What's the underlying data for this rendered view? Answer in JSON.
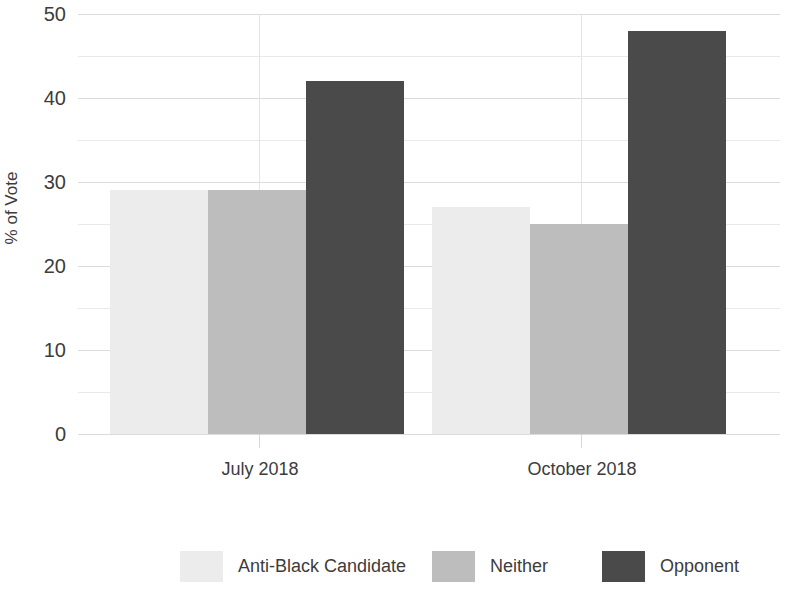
{
  "chart_data": {
    "type": "bar",
    "title": "",
    "xlabel": "",
    "ylabel": "% of Vote",
    "categories": [
      "July 2018",
      "October 2018"
    ],
    "series": [
      {
        "name": "Anti-Black Candidate",
        "color": "#ececec",
        "values": [
          29,
          27
        ]
      },
      {
        "name": "Neither",
        "color": "#bdbdbd",
        "values": [
          29,
          25
        ]
      },
      {
        "name": "Opponent",
        "color": "#4a4a4a",
        "values": [
          42,
          48
        ]
      }
    ],
    "ylim": [
      0,
      50
    ],
    "y_major_ticks": [
      0,
      10,
      20,
      30,
      40,
      50
    ],
    "y_minor_ticks": [
      5,
      15,
      25,
      35,
      45
    ],
    "y_tick_labels": [
      "0",
      "10",
      "20",
      "30",
      "40",
      "50"
    ],
    "grid": true,
    "legend_position": "bottom",
    "background_color": "#ffffff",
    "grid_color": "#e9e9e9"
  },
  "axis": {
    "y_title": "% of Vote",
    "y_ticks": [
      "50",
      "40",
      "30",
      "20",
      "10",
      "0"
    ],
    "x_ticks": [
      "July 2018",
      "October 2018"
    ]
  },
  "legend": {
    "items": [
      {
        "label": "Anti-Black Candidate"
      },
      {
        "label": "Neither"
      },
      {
        "label": "Opponent"
      }
    ]
  }
}
